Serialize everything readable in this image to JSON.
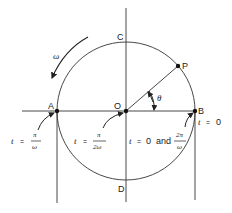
{
  "diagram": {
    "type": "reference-circle-uniform-circular-motion",
    "stroke_color": "#333333",
    "center": {
      "x": 126,
      "y": 111
    },
    "radius": 69,
    "points": {
      "A": {
        "label": "A",
        "x": 57,
        "y": 111
      },
      "O": {
        "label": "O",
        "x": 126,
        "y": 111
      },
      "B": {
        "label": "B",
        "x": 195,
        "y": 111
      },
      "C": {
        "label": "C",
        "x": 126,
        "y": 42
      },
      "D": {
        "label": "D",
        "x": 126,
        "y": 180
      },
      "P": {
        "label": "P",
        "x": 178,
        "y": 66
      }
    },
    "angle_label": "θ",
    "rotation_label": "ω",
    "annotations": {
      "A": {
        "prefix": "t",
        "eq": "=",
        "numerator": "π",
        "denominator": "ω"
      },
      "O": {
        "prefix": "t",
        "eq": "=",
        "numerator": "π",
        "denominator": "2ω"
      },
      "B_mid": {
        "prefix": "t",
        "eq": "=",
        "value": "0",
        "conj": "and",
        "numerator": "2π",
        "denominator": "ω"
      },
      "B": {
        "prefix": "t",
        "eq": "=",
        "value": "0"
      }
    }
  }
}
